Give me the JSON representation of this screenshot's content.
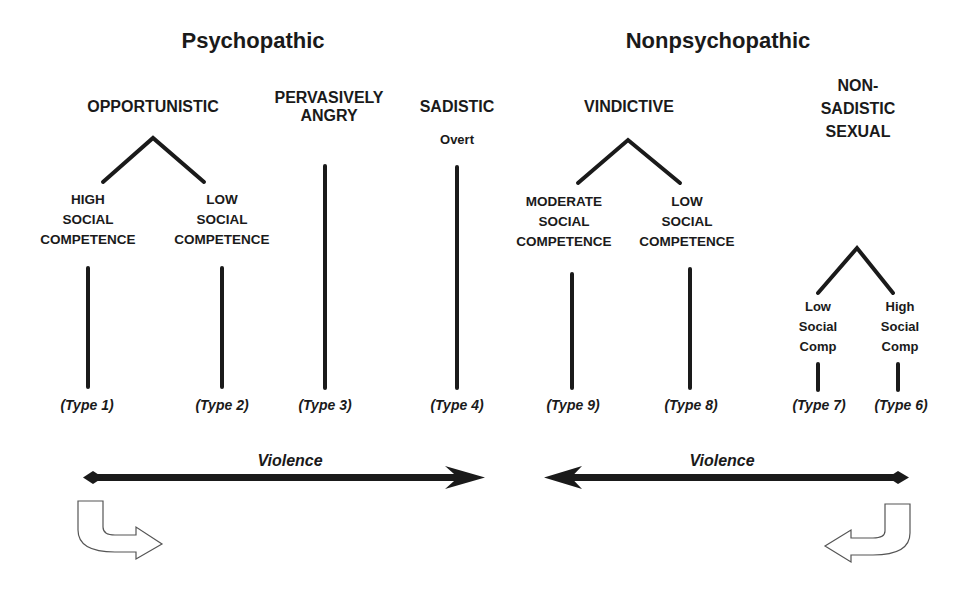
{
  "colors": {
    "ink": "#1a1a1a",
    "background": "#ffffff",
    "hollow_arrow_stroke": "#555555"
  },
  "headings": {
    "psychopathic": "Psychopathic",
    "nonpsychopathic": "Nonpsychopathic"
  },
  "psychopathic": {
    "opportunistic": {
      "label": "OPPORTUNISTIC",
      "branches": [
        {
          "lines": [
            "HIGH",
            "SOCIAL",
            "COMPETENCE"
          ],
          "type": "(Type 1)"
        },
        {
          "lines": [
            "LOW",
            "SOCIAL",
            "COMPETENCE"
          ],
          "type": "(Type 2)"
        }
      ]
    },
    "pervasively_angry": {
      "lines": [
        "PERVASIVELY",
        "ANGRY"
      ],
      "type": "(Type 3)"
    },
    "sadistic": {
      "label": "SADISTIC",
      "sublabel": "Overt",
      "type": "(Type 4)"
    },
    "violence_axis": {
      "label": "Violence",
      "direction": "left-to-right"
    },
    "curved_arrow": "curved-arrow-right-icon"
  },
  "nonpsychopathic": {
    "vindictive": {
      "label": "VINDICTIVE",
      "branches": [
        {
          "lines": [
            "MODERATE",
            "SOCIAL",
            "COMPETENCE"
          ],
          "type": "(Type 9)"
        },
        {
          "lines": [
            "LOW",
            "SOCIAL",
            "COMPETENCE"
          ],
          "type": "(Type 8)"
        }
      ]
    },
    "nonsadistic_sexual": {
      "lines": [
        "NON-",
        "SADISTIC",
        "SEXUAL"
      ],
      "branches": [
        {
          "lines": [
            "Low",
            "Social",
            "Comp"
          ],
          "type": "(Type 7)"
        },
        {
          "lines": [
            "High",
            "Social",
            "Comp"
          ],
          "type": "(Type 6)"
        }
      ]
    },
    "violence_axis": {
      "label": "Violence",
      "direction": "right-to-left"
    },
    "curved_arrow": "curved-arrow-left-icon"
  }
}
